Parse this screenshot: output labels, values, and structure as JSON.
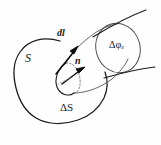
{
  "figure": {
    "kind": "vector-field-flux-tube-diagram",
    "background_color": "#fefefe",
    "ink_color": "#1a1a1a",
    "labels": {
      "surface": "S",
      "line_element": "dl",
      "normal_vector": "n",
      "area_element": "ΔS",
      "flux": "Δφ",
      "flux_subscript": "e"
    },
    "elements": {
      "closed_surface_name": "closed-surface-S",
      "area_patch_name": "area-element-delta-S",
      "tube_name": "flux-tube",
      "end_cap_name": "tube-end-cap-ellipse",
      "field_line_name": "field-line",
      "normal_arrow_name": "normal-vector-arrow",
      "line_element_arrow_name": "line-element-arrow"
    }
  }
}
